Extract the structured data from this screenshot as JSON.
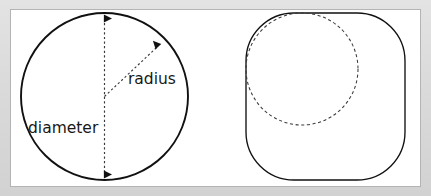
{
  "canvas": {
    "width": 431,
    "height": 196,
    "background_color": "#dcdcdc"
  },
  "frame": {
    "name": "figure-frame",
    "fill_color": "#ffffff",
    "border_color": "#b4b4b4"
  },
  "diagram": {
    "title": "",
    "stroke_color": "#111111",
    "dash_color": "#3a3a3a",
    "figures": [
      {
        "id": "left-figure",
        "shape": "circle",
        "description": "Solid circle annotated with radius and diameter",
        "center_x": 104.5,
        "center_y": 96.5,
        "radius": 83.5,
        "stroke_style": "solid",
        "annotations": [
          {
            "id": "diameter-arrow",
            "kind": "double-headed-arrow",
            "style": "dashed",
            "from_x": 104.5,
            "from_y": 13.0,
            "to_x": 104.5,
            "to_y": 180.0
          },
          {
            "id": "radius-arrow",
            "kind": "single-headed-arrow",
            "style": "dashed",
            "from_x": 104.5,
            "from_y": 96.5,
            "to_x": 162.0,
            "to_y": 42.0
          }
        ]
      },
      {
        "id": "right-figure",
        "shape": "rounded-square",
        "description": "Rounded square with an inscribed dashed circle in the upper-left",
        "x": 246.0,
        "y": 13.0,
        "width": 159.0,
        "height": 167.0,
        "corner_radius": 48.0,
        "stroke_style": "solid",
        "inner_circle": {
          "id": "dashed-circle",
          "shape": "circle",
          "center_x": 302.0,
          "center_y": 69.0,
          "radius": 56.0,
          "stroke_style": "dashed"
        }
      }
    ]
  },
  "labels": {
    "radius": "radius",
    "diameter": "diameter"
  }
}
